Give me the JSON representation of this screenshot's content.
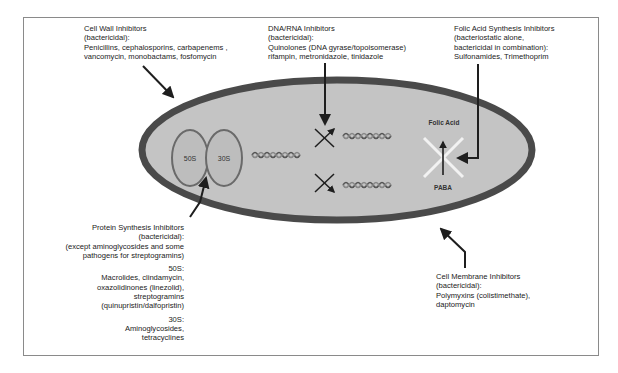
{
  "figure": {
    "colors": {
      "cell_fill": "#c4c4c4",
      "cell_wall": "#4a4a4a",
      "ribosome_fill": "#bdbdbd",
      "ribosome_stroke": "#6a6a6a",
      "arrow": "#1e1e1e",
      "inhibit_x_white": "#f2f2f2",
      "frame_border": "#8a8a8a"
    }
  },
  "labels": {
    "cell_wall": {
      "title": "Cell Wall Inhibitors",
      "type": "(bactericidal):",
      "drugs_line1": "Penicillins, cephalosporins, carbapenems ,",
      "drugs_line2": "vancomycin, monobactams, fosfomycin"
    },
    "dna_rna": {
      "title": "DNA/RNA Inhibitors",
      "type": "(bactericidal):",
      "drugs_line1": "Quinolones (DNA gyrase/topoisomerase)",
      "drugs_line2": "rifampin, metronidazole, tinidazole"
    },
    "folic_acid": {
      "title": "Folic Acid Synthesis Inhibitors",
      "type_line1": "(bacteriostatic alone,",
      "type_line2": "bactericidal in combination):",
      "drugs": "Sulfonamides, Trimethoprim"
    },
    "protein_synthesis": {
      "title": "Protein Synthesis Inhibitors",
      "type": "(bactericidal):",
      "note_line1": "(except aminoglycosides and some",
      "note_line2": "pathogens for streptogramins)",
      "s50_heading": "50S:",
      "s50_line1": "Macrolides, clindamycin,",
      "s50_line2": "oxazolidinones (linezolid),",
      "s50_line3": "streptogramins",
      "s50_line4": "(quinupristin/dalfopristin)",
      "s30_heading": "30S:",
      "s30_line1": "Aminoglycosides,",
      "s30_line2": "tetracyclines"
    },
    "cell_membrane": {
      "title": "Cell Membrane Inhibitors",
      "type": "(bactericidal):",
      "drugs_line1": "Polymyxins (colistimethate),",
      "drugs_line2": "daptomycin"
    }
  },
  "cell": {
    "ribosome_50s": "50S",
    "ribosome_30s": "30S",
    "folic_acid": "Folic Acid",
    "paba": "PABA"
  }
}
